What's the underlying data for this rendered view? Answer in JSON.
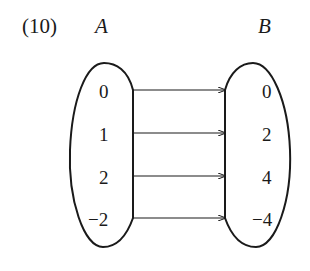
{
  "problem_label": "(10)",
  "set_a": {
    "label": "A",
    "elements": [
      "0",
      "1",
      "2",
      "−2"
    ]
  },
  "set_b": {
    "label": "B",
    "elements": [
      "0",
      "2",
      "4",
      "−4"
    ]
  },
  "mappings": [
    {
      "from": "0",
      "to": "0"
    },
    {
      "from": "1",
      "to": "2"
    },
    {
      "from": "2",
      "to": "4"
    },
    {
      "from": "−2",
      "to": "−4"
    }
  ],
  "colors": {
    "stroke": "#1a1a1a",
    "background": "#ffffff"
  }
}
